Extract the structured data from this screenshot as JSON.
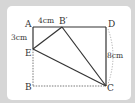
{
  "figure": {
    "type": "geometry-diagram",
    "points": {
      "A": {
        "label": "A",
        "x": 33,
        "y": 27
      },
      "B_prime": {
        "label": "B′",
        "x": 62,
        "y": 27
      },
      "D": {
        "label": "D",
        "x": 106,
        "y": 27
      },
      "E": {
        "label": "E",
        "x": 33,
        "y": 49
      },
      "B": {
        "label": "B",
        "x": 33,
        "y": 86
      },
      "C": {
        "label": "C",
        "x": 106,
        "y": 86
      }
    },
    "measurements": {
      "AB_prime": "4cm",
      "AE": "3cm",
      "DC": "8cm"
    },
    "colors": {
      "line": "#333333",
      "dashed": "#555555",
      "background": "#d6d6d6",
      "card": "#ffffff"
    }
  }
}
